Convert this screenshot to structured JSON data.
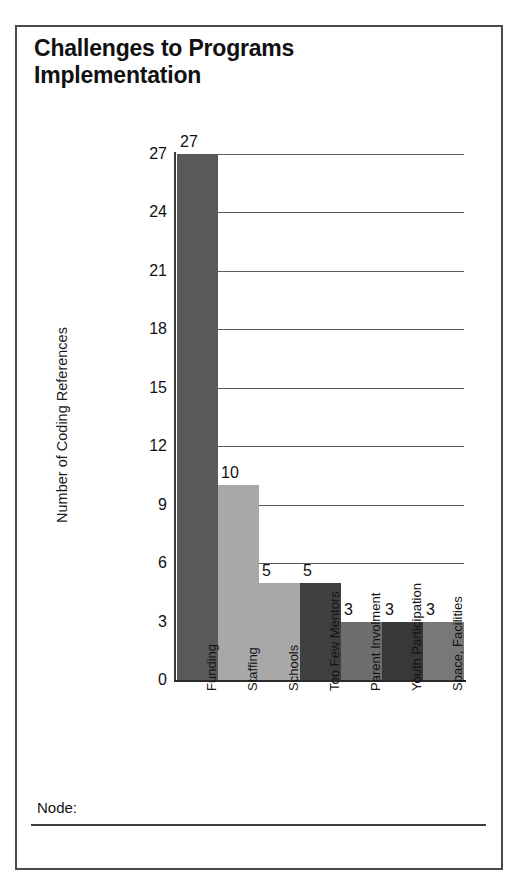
{
  "page": {
    "title": "Challenges to Programs\nImplementation",
    "footer": {
      "node_label": "Node:"
    }
  },
  "chart_data": {
    "type": "bar",
    "title": "Challenges to Programs Implementation",
    "xlabel": "",
    "ylabel": "Number of Coding References",
    "categories": [
      "Funding",
      "Staffing",
      "Schools",
      "Too Few Mentors",
      "Parent Involment",
      "Youth Participation",
      "Space, Facilities"
    ],
    "values": [
      27,
      10,
      5,
      5,
      3,
      3,
      3
    ],
    "value_labels": [
      "27",
      "10",
      "5",
      "5",
      "3",
      "3",
      "3"
    ],
    "bar_colors": [
      "#595959",
      "#a8a8a8",
      "#a8a8a8",
      "#404040",
      "#6e6e6e",
      "#383838",
      "#787878"
    ],
    "ylim": [
      0,
      27
    ],
    "ytick_labels": [
      "0",
      "3",
      "6",
      "9",
      "12",
      "15",
      "18",
      "21",
      "24",
      "27"
    ],
    "ytick_values": [
      0,
      3,
      6,
      9,
      12,
      15,
      18,
      21,
      24,
      27
    ],
    "grid": true,
    "legend": "none"
  }
}
